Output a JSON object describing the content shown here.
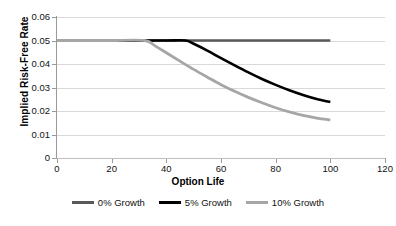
{
  "chart_data": {
    "type": "line",
    "title": "",
    "xlabel": "Option Life",
    "ylabel": "Implied Risk-Free Rate",
    "xlim": [
      0,
      120
    ],
    "ylim": [
      0,
      0.06
    ],
    "xticks": [
      "0",
      "20",
      "40",
      "60",
      "80",
      "100",
      "120"
    ],
    "xtick_values": [
      0,
      20,
      40,
      60,
      80,
      100,
      120
    ],
    "yticks": [
      "0",
      "0.01",
      "0.02",
      "0.03",
      "0.04",
      "0.05",
      "0.06"
    ],
    "ytick_values": [
      0,
      0.01,
      0.02,
      0.03,
      0.04,
      0.05,
      0.06
    ],
    "grid": "horizontal",
    "legend_position": "bottom",
    "background": "#ffffff",
    "gridline_color": "#d9d9d9",
    "axis_color": "#9a9a9a",
    "series": [
      {
        "name": "0% Growth",
        "color": "#595959",
        "width": 2.6,
        "x": [
          0,
          10,
          20,
          30,
          40,
          50,
          60,
          70,
          80,
          90,
          100
        ],
        "values": [
          0.05,
          0.05,
          0.05,
          0.05,
          0.05,
          0.05,
          0.05,
          0.05,
          0.05,
          0.05,
          0.05
        ]
      },
      {
        "name": "5% Growth",
        "color": "#000000",
        "width": 2.6,
        "x": [
          0,
          10,
          20,
          30,
          40,
          47,
          50,
          55,
          60,
          65,
          70,
          75,
          80,
          85,
          90,
          95,
          100
        ],
        "values": [
          0.05,
          0.05,
          0.05,
          0.05,
          0.05,
          0.05,
          0.0486,
          0.0457,
          0.0425,
          0.0394,
          0.0364,
          0.0336,
          0.0311,
          0.0288,
          0.0268,
          0.0251,
          0.0238
        ]
      },
      {
        "name": "10% Growth",
        "color": "#a6a6a6",
        "width": 2.8,
        "x": [
          0,
          10,
          20,
          32,
          36,
          40,
          45,
          50,
          55,
          60,
          65,
          70,
          75,
          80,
          85,
          90,
          95,
          100
        ],
        "values": [
          0.05,
          0.05,
          0.05,
          0.05,
          0.0476,
          0.0448,
          0.0412,
          0.0377,
          0.0344,
          0.0312,
          0.0284,
          0.0258,
          0.0235,
          0.0214,
          0.0196,
          0.0181,
          0.017,
          0.0162
        ]
      }
    ]
  },
  "legend": {
    "items": [
      {
        "label": "0% Growth",
        "color": "#595959"
      },
      {
        "label": "5% Growth",
        "color": "#000000"
      },
      {
        "label": "10% Growth",
        "color": "#a6a6a6"
      }
    ]
  }
}
